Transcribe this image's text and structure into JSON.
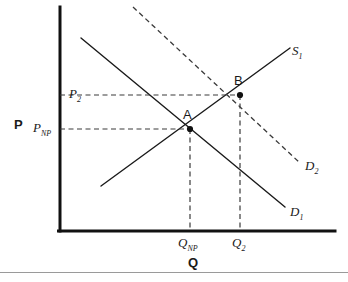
{
  "figure": {
    "background_color": "#ffffff",
    "line_color": "#1a1a1a",
    "dash_color": "#3a3a3a",
    "axis_color": "#111111"
  },
  "axes": {
    "x_title": "Q",
    "y_title": "P",
    "origin_px": [
      60,
      231
    ],
    "x_axis_end_px": [
      335,
      231
    ],
    "y_axis_top_px": [
      60,
      7
    ]
  },
  "y_ticks": [
    {
      "id": "p2",
      "base": "P",
      "subscript": "2",
      "y_px": 95
    },
    {
      "id": "pnp",
      "base": "P",
      "subscript": "NP",
      "y_px": 129
    }
  ],
  "x_ticks": [
    {
      "id": "qnp",
      "base": "Q",
      "subscript": "NP",
      "x_px": 190
    },
    {
      "id": "q2",
      "base": "Q",
      "subscript": "2",
      "x_px": 240
    }
  ],
  "curves": [
    {
      "id": "supply1",
      "base": "S",
      "subscript": "1",
      "style": "solid",
      "from_px": [
        101,
        186
      ],
      "to_px": [
        290,
        48
      ],
      "label_px": [
        292,
        44
      ]
    },
    {
      "id": "demand1",
      "base": "D",
      "subscript": "1",
      "style": "solid",
      "from_px": [
        81,
        38
      ],
      "to_px": [
        285,
        207
      ],
      "label_px": [
        290,
        205
      ]
    },
    {
      "id": "demand2",
      "base": "D",
      "subscript": "2",
      "style": "dashed",
      "from_px": [
        133,
        7
      ],
      "to_px": [
        300,
        163
      ],
      "label_px": [
        305,
        159
      ]
    }
  ],
  "points": [
    {
      "id": "a",
      "label": "A",
      "x_px": 190,
      "y_px": 129,
      "label_px": [
        183,
        110
      ]
    },
    {
      "id": "b",
      "label": "B",
      "x_px": 240,
      "y_px": 95,
      "label_px": [
        234,
        76
      ]
    }
  ],
  "guide_lines": [
    {
      "id": "p2-to-b",
      "orientation": "horizontal",
      "from_px": [
        60,
        95
      ],
      "to_px": [
        240,
        95
      ]
    },
    {
      "id": "pnp-to-a",
      "orientation": "horizontal",
      "from_px": [
        60,
        129
      ],
      "to_px": [
        190,
        129
      ]
    },
    {
      "id": "a-to-qnp",
      "orientation": "vertical",
      "from_px": [
        190,
        129
      ],
      "to_px": [
        190,
        231
      ]
    },
    {
      "id": "b-to-q2",
      "orientation": "vertical",
      "from_px": [
        240,
        95
      ],
      "to_px": [
        240,
        231
      ]
    }
  ]
}
